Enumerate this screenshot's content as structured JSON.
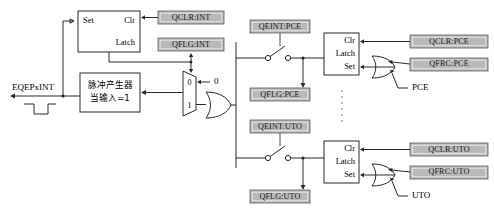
{
  "diagram": {
    "output_signal": {
      "label": "EQEPxINT",
      "waveform_name": "active-low-pulse"
    },
    "top_latch": {
      "set_label": "Set",
      "clr_label": "Clr",
      "latch_label": "Latch"
    },
    "pulse_generator": {
      "line1": "脉冲产生器",
      "line2": "当输入=1"
    },
    "mux": {
      "input_0_label": "0",
      "input_1_label": "1",
      "select_value_label": "0"
    },
    "registers": {
      "qclr_int": "QCLR:INT",
      "qflg_int": "QFLG:INT",
      "qeint_pce": "QEINT:PCE",
      "qflg_pce": "QFLG:PCE",
      "qclr_pce": "QCLR:PCE",
      "qfrc_pce": "QFRC:PCE",
      "qeint_uto": "QEINT:UTO",
      "qflg_uto": "QFLG:UTO",
      "qclr_uto": "QCLR:UTO",
      "qfrc_uto": "QFRC:UTO"
    },
    "pce_latch": {
      "clr_label": "Clr",
      "latch_label": "Latch",
      "set_label": "Set"
    },
    "uto_latch": {
      "clr_label": "Clr",
      "latch_label": "Latch",
      "set_label": "Set"
    },
    "event_inputs": {
      "pce": "PCE",
      "uto": "UTO"
    },
    "colors": {
      "register_fill": "#b9b9b9",
      "register_stroke": "#5a5a5a",
      "wire": "#2a2a2a",
      "background": "#ffffff"
    }
  }
}
